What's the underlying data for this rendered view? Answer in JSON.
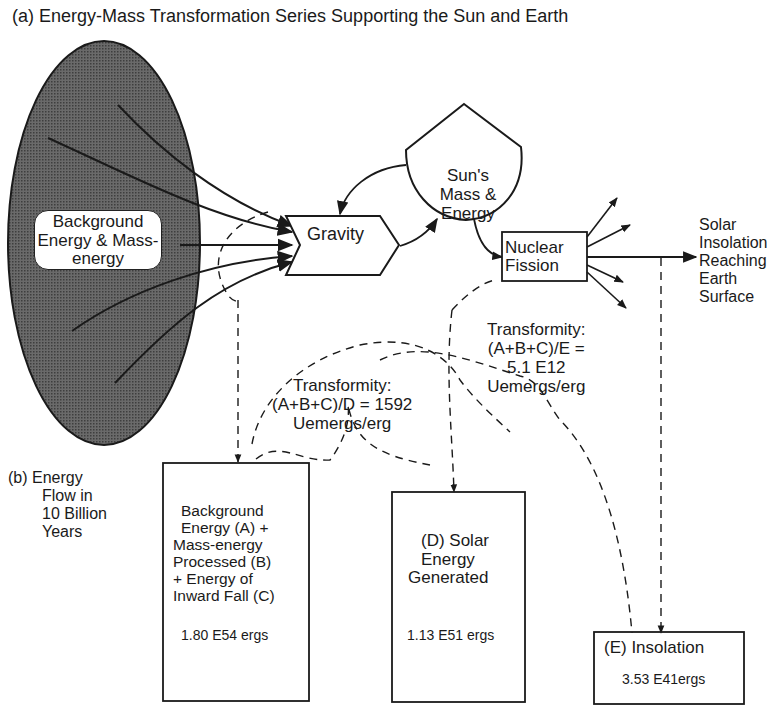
{
  "title": "(a) Energy-Mass Transformation Series Supporting the Sun and Earth",
  "nodes": {
    "background_source": {
      "label": "Background Energy & Mass-energy"
    },
    "gravity": {
      "label": "Gravity"
    },
    "sun": {
      "label_lines": [
        "Sun's",
        "Mass &",
        "Energy"
      ]
    },
    "nuclear_fission": {
      "label_lines": [
        "Nuclear",
        "Fission"
      ]
    },
    "solar_insolation_output": {
      "label_lines": [
        "Solar",
        "Insolation",
        "Reaching",
        "Earth",
        "Surface"
      ]
    }
  },
  "transformities": [
    {
      "id": "D",
      "lines": [
        "Transformity:",
        "(A+B+C)/D = 1592",
        "Uemergs/erg"
      ]
    },
    {
      "id": "E",
      "lines": [
        "Transformity:",
        "(A+B+C)/E =",
        "5.1 E12",
        "Uemergs/erg"
      ]
    }
  ],
  "section_b": {
    "label_lines": [
      "(b) Energy",
      "Flow in",
      "10 Billion",
      "Years"
    ],
    "boxes": [
      {
        "id": "ABC",
        "lines": [
          "Background",
          "Energy (A) +",
          "Mass-energy",
          "Processed (B)",
          "+ Energy of",
          "Inward Fall (C)"
        ],
        "value": "1.80 E54 ergs"
      },
      {
        "id": "D",
        "lines": [
          "(D) Solar",
          "Energy",
          "Generated"
        ],
        "value": "1.13 E51 ergs"
      },
      {
        "id": "E",
        "lines": [
          "(E) Insolation"
        ],
        "value": "3.53 E41ergs"
      }
    ]
  },
  "colors": {
    "ink": "#1a1a1a",
    "source_fill": "#5a5a5a",
    "background": "#ffffff"
  }
}
